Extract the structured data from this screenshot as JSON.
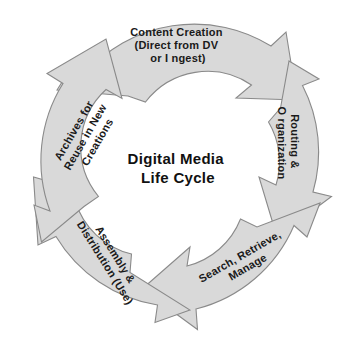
{
  "diagram": {
    "title": "Digital Media Life Cycle",
    "type": "circular-cycle",
    "center": {
      "line1": "Digital  Media",
      "line2": "Life  Cycle"
    },
    "style": {
      "segment_fill": "#d9d9d9",
      "segment_stroke": "#8a8a8a",
      "text_color": "#1a1a1a",
      "background": "#ffffff"
    },
    "geometry": {
      "center_x": 178,
      "center_y": 170,
      "inner_radius": 68,
      "outer_radius": 145
    },
    "stages": [
      {
        "id": "content-creation",
        "order": 1,
        "lines": [
          "Content  Creation",
          "(Direct  from  DV",
          "or I  ngest)"
        ],
        "position": "top",
        "rotation_deg": 0
      },
      {
        "id": "routing-organization",
        "order": 2,
        "lines": [
          "Routing  &",
          "O rganization"
        ],
        "position": "right",
        "rotation_deg": 90
      },
      {
        "id": "search-retrieve-manage",
        "order": 3,
        "lines": [
          "Search,  Retrieve,",
          "Manage"
        ],
        "position": "bottom-right",
        "rotation_deg": -30
      },
      {
        "id": "assembly-distribution",
        "order": 4,
        "lines": [
          "Assembly  &",
          "Distribution  (Use)"
        ],
        "position": "bottom-left",
        "rotation_deg": 58
      },
      {
        "id": "archives-reuse",
        "order": 5,
        "lines": [
          "Archives  for",
          "Reuse  in  New",
          "Creations"
        ],
        "position": "left",
        "rotation_deg": -60
      }
    ]
  }
}
